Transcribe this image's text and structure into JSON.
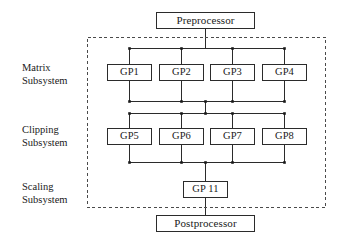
{
  "diagram": {
    "type": "block-flow-diagram",
    "background_color": "#ffffff",
    "line_color": "#2b2b2b",
    "dashed_border_color": "#4a4a4a",
    "endpoints": {
      "preprocessor": "Preprocessor",
      "postprocessor": "Postprocessor"
    },
    "subsystems": [
      {
        "name": "matrix",
        "label": "Matrix\nSubsystem",
        "nodes": [
          "GP1",
          "GP2",
          "GP3",
          "GP4"
        ]
      },
      {
        "name": "clipping",
        "label": "Clipping\nSubsystem",
        "nodes": [
          "GP5",
          "GP6",
          "GP7",
          "GP8"
        ]
      },
      {
        "name": "scaling",
        "label": "Scaling\nSubsystem",
        "nodes": [
          "GP 11"
        ]
      }
    ],
    "nodes": {
      "gp1": "GP1",
      "gp2": "GP2",
      "gp3": "GP3",
      "gp4": "GP4",
      "gp5": "GP5",
      "gp6": "GP6",
      "gp7": "GP7",
      "gp8": "GP8",
      "gp11": "GP 11"
    }
  }
}
